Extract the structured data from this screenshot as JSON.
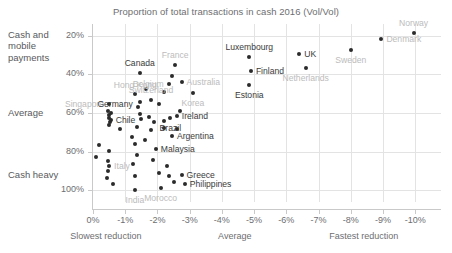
{
  "chart_data": {
    "type": "scatter",
    "title": "Proportion of total transactions in cash 2016 (Vol/Vol)",
    "xlabel": "",
    "ylabel": "",
    "xlim": [
      0,
      -10.8
    ],
    "ylim": [
      14,
      106
    ],
    "grid": true,
    "y_inverted": true,
    "xticks": [
      "0%",
      "-1%",
      "-2%",
      "-3%",
      "-4%",
      "-5%",
      "-6%",
      "-7%",
      "-8%",
      "-9%",
      "-10%"
    ],
    "xtick_values": [
      0,
      -1,
      -2,
      -3,
      -4,
      -5,
      -6,
      -7,
      -8,
      -9,
      -10
    ],
    "yticks": [
      "20%",
      "40%",
      "60%",
      "80%",
      "100%"
    ],
    "ytick_values": [
      20,
      40,
      60,
      80,
      100
    ],
    "y_category_labels": [
      {
        "text": "Cash and mobile payments",
        "value": 20
      },
      {
        "text": "Average",
        "value": 60
      },
      {
        "text": "Cash heavy",
        "value": 92
      }
    ],
    "x_axis_annotations": [
      {
        "text": "Slowest reduction",
        "value": -0.4
      },
      {
        "text": "Average",
        "value": -4.4
      },
      {
        "text": "Fastest reduction",
        "value": -8.4
      }
    ],
    "points": [
      {
        "name": "Norway",
        "x": -9.95,
        "y": 18.5,
        "label_pos": "above",
        "label_style": "light"
      },
      {
        "name": "Denmark",
        "x": -8.95,
        "y": 21.5,
        "label_pos": "right",
        "label_style": "light"
      },
      {
        "name": "Sweden",
        "x": -8.0,
        "y": 27.5,
        "label_pos": "below-center",
        "label_style": "light"
      },
      {
        "name": "UK",
        "x": -6.4,
        "y": 29.5,
        "label_pos": "right",
        "label_style": "dark"
      },
      {
        "name": "Netherlands",
        "x": -6.6,
        "y": 36.5,
        "label_pos": "below-center",
        "label_style": "light"
      },
      {
        "name": "Luxembourg",
        "x": -4.85,
        "y": 31.0,
        "label_pos": "above-center",
        "label_style": "dark"
      },
      {
        "name": "Finland",
        "x": -4.9,
        "y": 38.5,
        "label_pos": "right",
        "label_style": "dark"
      },
      {
        "name": "Estonia",
        "x": -4.85,
        "y": 45.5,
        "label_pos": "below-center",
        "label_style": "dark"
      },
      {
        "name": "France",
        "x": -2.55,
        "y": 35.0,
        "label_pos": "above-center",
        "label_style": "light"
      },
      {
        "name": "Canada",
        "x": -1.45,
        "y": 39.5,
        "label_pos": "above-center",
        "label_style": "dark"
      },
      {
        "name": "Australia",
        "x": -2.75,
        "y": 44.0,
        "label_pos": "right",
        "label_style": "light"
      },
      {
        "name": "Belgium",
        "x": -2.35,
        "y": 45.0,
        "label_pos": "left",
        "label_style": "light"
      },
      {
        "name": "Korea",
        "x": -3.1,
        "y": 49.5,
        "label_pos": "below-center",
        "label_style": "light"
      },
      {
        "name": "Hong Kong",
        "x": -1.3,
        "y": 50.0,
        "label_pos": "above-left",
        "label_style": "light"
      },
      {
        "name": "Switzerland",
        "x": -1.8,
        "y": 53.5,
        "label_pos": "above-center",
        "label_style": "light"
      },
      {
        "name": "Singapore",
        "x": -0.5,
        "y": 55.5,
        "label_pos": "left",
        "label_style": "light"
      },
      {
        "name": "Germany",
        "x": -0.55,
        "y": 60.0,
        "label_pos": "above-left",
        "label_style": "dark"
      },
      {
        "name": "Ireland",
        "x": -2.6,
        "y": 61.5,
        "label_pos": "right",
        "label_style": "dark"
      },
      {
        "name": "Brazil",
        "x": -2.4,
        "y": 62.5,
        "label_pos": "below-center",
        "label_style": "dark"
      },
      {
        "name": "Chile",
        "x": -0.55,
        "y": 63.5,
        "label_pos": "right",
        "label_style": "dark"
      },
      {
        "name": "Argentina",
        "x": -2.45,
        "y": 72.0,
        "label_pos": "right",
        "label_style": "dark"
      },
      {
        "name": "Malaysia",
        "x": -1.95,
        "y": 78.5,
        "label_pos": "right",
        "label_style": "dark"
      },
      {
        "name": "Italy",
        "x": -0.5,
        "y": 87.5,
        "label_pos": "right",
        "label_style": "light"
      },
      {
        "name": "Greece",
        "x": -2.75,
        "y": 92.0,
        "label_pos": "right",
        "label_style": "dark"
      },
      {
        "name": "Philippines",
        "x": -2.85,
        "y": 96.5,
        "label_pos": "right",
        "label_style": "dark"
      },
      {
        "name": "India",
        "x": -1.3,
        "y": 100.0,
        "label_pos": "below-center",
        "label_style": "light"
      },
      {
        "name": "Morocco",
        "x": -2.1,
        "y": 99.0,
        "label_pos": "below-center",
        "label_style": "light"
      }
    ],
    "unlabeled_points": [
      {
        "x": -0.45,
        "y": 59.0
      },
      {
        "x": -0.5,
        "y": 61.0
      },
      {
        "x": -0.5,
        "y": 62.5
      },
      {
        "x": -0.52,
        "y": 64.5
      },
      {
        "x": -0.5,
        "y": 66.0
      },
      {
        "x": -0.85,
        "y": 68.5
      },
      {
        "x": -0.18,
        "y": 76.5
      },
      {
        "x": -0.5,
        "y": 79.5
      },
      {
        "x": -0.08,
        "y": 82.5
      },
      {
        "x": -0.45,
        "y": 85.0
      },
      {
        "x": -0.45,
        "y": 90.0
      },
      {
        "x": -0.42,
        "y": 93.5
      },
      {
        "x": -0.62,
        "y": 96.5
      },
      {
        "x": -1.4,
        "y": 57.0
      },
      {
        "x": -1.45,
        "y": 60.5
      },
      {
        "x": -1.5,
        "y": 63.0
      },
      {
        "x": -1.35,
        "y": 67.0
      },
      {
        "x": -1.2,
        "y": 72.5
      },
      {
        "x": -1.3,
        "y": 76.0
      },
      {
        "x": -1.35,
        "y": 81.5
      },
      {
        "x": -1.25,
        "y": 86.5
      },
      {
        "x": -1.3,
        "y": 92.5
      },
      {
        "x": -1.75,
        "y": 62.0
      },
      {
        "x": -1.9,
        "y": 64.5
      },
      {
        "x": -1.8,
        "y": 69.0
      },
      {
        "x": -1.6,
        "y": 74.0
      },
      {
        "x": -1.85,
        "y": 84.5
      },
      {
        "x": -2.05,
        "y": 91.0
      },
      {
        "x": -2.2,
        "y": 64.0
      },
      {
        "x": -2.2,
        "y": 67.5
      },
      {
        "x": -2.3,
        "y": 87.5
      },
      {
        "x": -2.35,
        "y": 92.5
      },
      {
        "x": -2.5,
        "y": 95.5
      },
      {
        "x": -2.7,
        "y": 59.0
      },
      {
        "x": -2.05,
        "y": 55.5
      },
      {
        "x": -2.2,
        "y": 49.0
      },
      {
        "x": -1.65,
        "y": 47.5
      },
      {
        "x": -1.45,
        "y": 54.5
      },
      {
        "x": -2.45,
        "y": 41.0
      },
      {
        "x": -2.6,
        "y": 68.5
      }
    ]
  }
}
